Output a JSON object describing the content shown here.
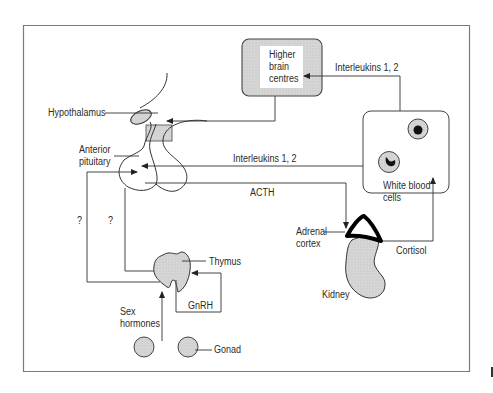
{
  "diagram": {
    "title": "",
    "nodes": {
      "higher_brain": {
        "line1": "Higher",
        "line2": "brain",
        "line3": "centres"
      },
      "hypothalamus": "Hypothalamus",
      "anterior_pituitary": {
        "line1": "Anterior",
        "line2": "pituitary"
      },
      "white_blood_cells": {
        "line1": "White blood",
        "line2": "cells"
      },
      "adrenal_cortex": {
        "line1": "Adrenal",
        "line2": "cortex"
      },
      "kidney": "Kidney",
      "thymus": "Thymus",
      "gonad": "Gonad",
      "sex_hormones": {
        "line1": "Sex",
        "line2": "hormones"
      }
    },
    "edges": {
      "il_to_brain": "Interleukins 1, 2",
      "il_to_pituitary": "Interleukins 1, 2",
      "acth": "ACTH",
      "cortisol": "Cortisol",
      "gnrh": "GnRH",
      "q1": "?",
      "q2": "?"
    },
    "colors": {
      "line": "#3a3a3a",
      "fill_grey": "#d4d4d4",
      "frame": "#777777"
    }
  }
}
